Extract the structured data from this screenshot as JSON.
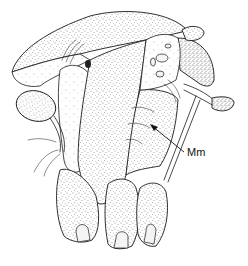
{
  "figure": {
    "labels": [
      {
        "text": "Mm",
        "points_to": "mandible region"
      }
    ],
    "ink_color": "#1a1a1a",
    "background_color": "#ffffff"
  }
}
